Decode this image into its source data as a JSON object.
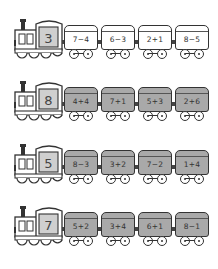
{
  "worksheet": {
    "trains": [
      {
        "engine_number": "3",
        "wagon_style": "white",
        "wagons": [
          {
            "label": "7−4"
          },
          {
            "label": "6−3"
          },
          {
            "label": "2+1"
          },
          {
            "label": "8−5"
          }
        ]
      },
      {
        "engine_number": "8",
        "wagon_style": "grey",
        "wagons": [
          {
            "label": "4+4"
          },
          {
            "label": "7+1"
          },
          {
            "label": "5+3"
          },
          {
            "label": "2+6"
          }
        ]
      },
      {
        "engine_number": "5",
        "wagon_style": "grey",
        "wagons": [
          {
            "label": "8−3"
          },
          {
            "label": "3+2"
          },
          {
            "label": "7−2"
          },
          {
            "label": "1+4"
          }
        ]
      },
      {
        "engine_number": "7",
        "wagon_style": "grey",
        "wagons": [
          {
            "label": "5+2"
          },
          {
            "label": "3+4"
          },
          {
            "label": "6+1"
          },
          {
            "label": "8−1"
          }
        ]
      }
    ],
    "colors": {
      "outline": "#333333",
      "grey_wagon": "#a9a9a9",
      "engine_cab": "#cfcfcf",
      "white_wagon": "#ffffff"
    }
  }
}
